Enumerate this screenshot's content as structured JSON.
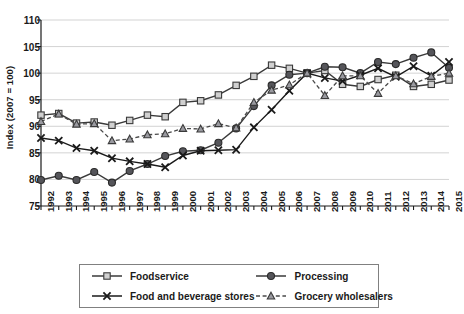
{
  "chart_data": {
    "type": "line",
    "title": "",
    "xlabel": "",
    "ylabel": "Index (2007 = 100)",
    "ylim": [
      75,
      110
    ],
    "yticks": [
      75,
      80,
      85,
      90,
      95,
      100,
      105,
      110
    ],
    "grid": true,
    "grid_axis": "y",
    "legend_position": "bottom",
    "x": [
      1992,
      1993,
      1994,
      1995,
      1996,
      1997,
      1998,
      1999,
      2000,
      2001,
      2002,
      2003,
      2004,
      2005,
      2006,
      2007,
      2008,
      2009,
      2010,
      2011,
      2012,
      2013,
      2014,
      2015
    ],
    "categories": [
      "1992",
      "1993",
      "1994",
      "1995",
      "1996",
      "1997",
      "1998",
      "1999",
      "2000",
      "2001",
      "2002",
      "2003",
      "2004",
      "2005",
      "2006",
      "2007",
      "2008",
      "2009",
      "2010",
      "2011",
      "2012",
      "2013",
      "2014",
      "2015"
    ],
    "series": [
      {
        "name": "Foodservice",
        "marker": "square-open",
        "linestyle": "solid",
        "color": "#3a3a3a",
        "values": [
          92.1,
          92.4,
          90.6,
          90.8,
          90.2,
          91.1,
          92.1,
          91.8,
          94.5,
          94.8,
          95.9,
          97.7,
          99.4,
          101.5,
          100.9,
          100.0,
          100.5,
          97.9,
          97.5,
          98.8,
          99.6,
          97.5,
          97.9,
          98.7
        ]
      },
      {
        "name": "Processing",
        "marker": "circle-filled",
        "linestyle": "solid",
        "color": "#3a3a3a",
        "values": [
          79.9,
          80.7,
          79.9,
          81.4,
          79.4,
          81.6,
          82.9,
          84.4,
          85.3,
          85.5,
          86.9,
          89.6,
          93.8,
          97.7,
          99.7,
          100.0,
          101.2,
          101.1,
          100.0,
          102.1,
          101.7,
          102.9,
          103.9,
          101.0
        ]
      },
      {
        "name": "Food and beverage stores",
        "marker": "x",
        "linestyle": "solid",
        "color": "#1a1a1a",
        "values": [
          87.8,
          87.3,
          85.9,
          85.4,
          84.0,
          83.4,
          82.9,
          82.3,
          84.5,
          85.4,
          85.5,
          85.6,
          89.8,
          93.1,
          96.7,
          100.0,
          99.1,
          98.5,
          99.6,
          100.9,
          99.3,
          101.3,
          99.5,
          102.1
        ]
      },
      {
        "name": "Grocery wholesalers",
        "marker": "triangle",
        "linestyle": "dashed",
        "color": "#4a4a4a",
        "values": [
          90.9,
          92.3,
          90.4,
          90.5,
          87.3,
          87.6,
          88.4,
          88.6,
          89.6,
          89.5,
          90.5,
          89.7,
          94.5,
          96.8,
          97.8,
          100.0,
          95.8,
          99.5,
          99.5,
          96.2,
          99.5,
          98.0,
          99.4,
          100.0
        ]
      }
    ]
  },
  "legend": {
    "entries": [
      {
        "label": "Foodservice",
        "symbol": "square-open-marker"
      },
      {
        "label": "Processing",
        "symbol": "circle-filled-marker"
      },
      {
        "label": "Food and beverage stores",
        "symbol": "x-marker"
      },
      {
        "label": "Grocery wholesalers",
        "symbol": "triangle-dashed-marker"
      }
    ]
  }
}
